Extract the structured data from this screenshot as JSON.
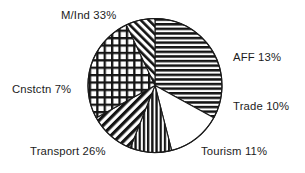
{
  "chart_data": {
    "type": "pie",
    "title": "",
    "subtitle": "",
    "xlabel": "",
    "ylabel": "",
    "legend_position": "none",
    "grid": false,
    "label_format": "{name} {value}%",
    "start_angle_deg": 0,
    "direction": "clockwise",
    "categories": [
      "M/Ind",
      "AFF",
      "Trade",
      "Tourism",
      "Transport",
      "Cnstctn"
    ],
    "values": [
      33,
      13,
      10,
      11,
      26,
      7
    ],
    "total": 100,
    "slices": [
      {
        "name": "M/Ind",
        "value": 33,
        "label": "M/Ind 33%",
        "pattern": "horizontal-stripes",
        "fill": "#ffffff",
        "stroke": "#1a1a1a"
      },
      {
        "name": "AFF",
        "value": 13,
        "label": "AFF 13%",
        "pattern": "solid-white",
        "fill": "#ffffff",
        "stroke": "#1a1a1a"
      },
      {
        "name": "Trade",
        "value": 10,
        "label": "Trade 10%",
        "pattern": "vertical-stripes",
        "fill": "#ffffff",
        "stroke": "#1a1a1a"
      },
      {
        "name": "Tourism",
        "value": 11,
        "label": "Tourism 11%",
        "pattern": "diagonal-stripes-up",
        "fill": "#ffffff",
        "stroke": "#1a1a1a"
      },
      {
        "name": "Transport",
        "value": 26,
        "label": "Transport 26%",
        "pattern": "crosshatch-grid",
        "fill": "#ffffff",
        "stroke": "#1a1a1a"
      },
      {
        "name": "Cnstctn",
        "value": 7,
        "label": "Cnstctn 7%",
        "pattern": "diagonal-stripes-down",
        "fill": "#ffffff",
        "stroke": "#1a1a1a"
      }
    ]
  },
  "colors": {
    "background": "#ffffff",
    "ink": "#1c1c1c",
    "outline": "#1a1a1a"
  }
}
